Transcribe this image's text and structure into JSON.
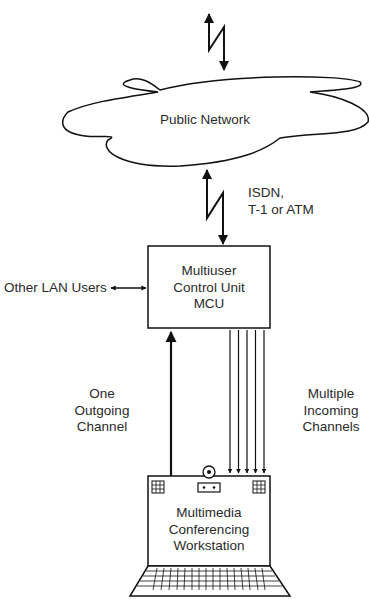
{
  "diagram": {
    "type": "network-topology",
    "colors": {
      "stroke": "#111111",
      "text": "#2a2a2a",
      "background": "#ffffff"
    },
    "nodes": {
      "public_network": {
        "label": "Public Network",
        "shape": "cloud"
      },
      "mcu": {
        "lines": [
          "Multiuser",
          "Control Unit",
          "MCU"
        ],
        "shape": "rectangle"
      },
      "workstation": {
        "lines": [
          "Multimedia",
          "Conferencing",
          "Workstation"
        ],
        "shape": "laptop"
      },
      "other_lan": {
        "label": "Other LAN Users"
      }
    },
    "links": {
      "top_link": {
        "from": "offscreen-top",
        "to": "public_network",
        "style": "lightning-bidirectional"
      },
      "wan_link": {
        "from": "public_network",
        "to": "mcu",
        "style": "lightning-bidirectional",
        "lines": [
          "ISDN,",
          "T-1 or ATM"
        ]
      },
      "lan_link": {
        "from": "other_lan",
        "to": "mcu",
        "style": "bidirectional-arrow"
      },
      "outgoing": {
        "from": "workstation",
        "to": "mcu",
        "count": 1,
        "lines": [
          "One",
          "Outgoing",
          "Channel"
        ]
      },
      "incoming": {
        "from": "mcu",
        "to": "workstation",
        "count": 5,
        "lines": [
          "Multiple",
          "Incoming",
          "Channels"
        ]
      }
    }
  }
}
